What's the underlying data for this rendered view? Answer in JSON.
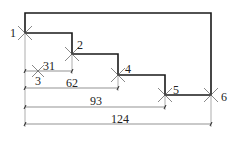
{
  "diagram": {
    "type": "stepped-profile-with-chain-dimensions",
    "outline_color": "#1a1a1a",
    "dim_color": "#666666",
    "points": [
      {
        "id": "1",
        "label": "1",
        "x": 25,
        "y": 33
      },
      {
        "id": "2",
        "label": "2",
        "x": 72,
        "y": 54
      },
      {
        "id": "3",
        "label": "3",
        "x": 38,
        "y": 71
      },
      {
        "id": "4",
        "label": "4",
        "x": 118,
        "y": 75
      },
      {
        "id": "5",
        "label": "5",
        "x": 165,
        "y": 95
      },
      {
        "id": "6",
        "label": "6",
        "x": 211,
        "y": 95
      }
    ],
    "dimensions": [
      {
        "label": "31",
        "value": 31
      },
      {
        "label": "62",
        "value": 62
      },
      {
        "label": "93",
        "value": 93
      },
      {
        "label": "124",
        "value": 124
      }
    ]
  }
}
